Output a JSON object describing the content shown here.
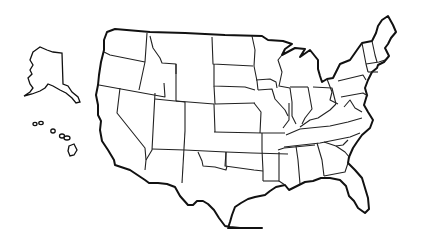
{
  "map": {
    "type": "blank-outline-map",
    "region": "United States",
    "colors": {
      "background": "#ffffff",
      "outline": "#111111",
      "state_border": "#222222"
    },
    "insets": [
      "alaska",
      "hawaii"
    ],
    "labels": []
  }
}
